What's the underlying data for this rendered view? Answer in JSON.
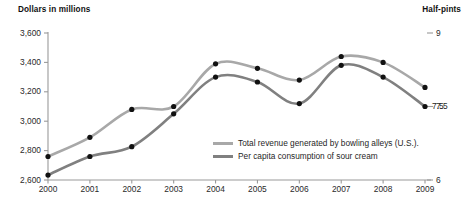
{
  "chart_data": {
    "type": "line",
    "title": "",
    "left_axis": {
      "label": "Dollars in millions",
      "ticks": [
        "3,600",
        "3,400",
        "3,200",
        "3,000",
        "2,800",
        "2,600"
      ],
      "tick_values": [
        3600,
        3400,
        3200,
        3000,
        2800,
        2600
      ],
      "ylim": [
        2600,
        3600
      ]
    },
    "right_axis": {
      "label": "Half-pints",
      "ticks": [
        "9",
        "7.5",
        "6"
      ],
      "tick_values": [
        9,
        7.5,
        6
      ],
      "ylim": [
        6,
        9
      ]
    },
    "xlabel": "",
    "categories": [
      "2000",
      "2001",
      "2002",
      "2003",
      "2004",
      "2005",
      "2006",
      "2007",
      "2008",
      "2009"
    ],
    "x": [
      2000,
      2001,
      2002,
      2003,
      2004,
      2005,
      2006,
      2007,
      2008,
      2009
    ],
    "grid": false,
    "legend_position": "inside-bottom-right",
    "series": [
      {
        "name": "Total revenue generated by bowling alleys (U.S.)",
        "axis": "left",
        "color": "#a8a8a8",
        "values": [
          2760,
          2890,
          3080,
          3100,
          3390,
          3360,
          3280,
          3440,
          3400,
          3230
        ]
      },
      {
        "name": "Per capita consumption of sour cream",
        "axis": "right",
        "color": "#808080",
        "values": [
          6.1,
          6.48,
          6.68,
          7.35,
          8.1,
          8.0,
          7.56,
          8.34,
          8.1,
          7.5
        ]
      }
    ],
    "end_annotations": [
      {
        "text": "7.5",
        "series": "Per capita consumption of sour cream",
        "at": "2009"
      }
    ]
  },
  "legend": {
    "items": [
      {
        "label": "Total revenue generated by bowling alleys (U.S.).",
        "color": "#a8a8a8"
      },
      {
        "label": "Per capita consumption of sour cream",
        "color": "#808080"
      }
    ]
  }
}
